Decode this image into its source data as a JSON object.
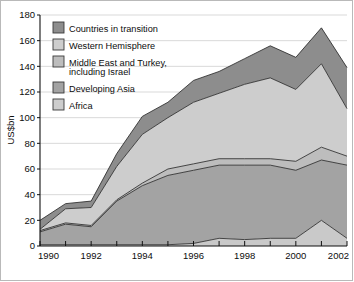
{
  "chart_data": {
    "type": "area",
    "stacked": true,
    "title": "",
    "xlabel": "",
    "ylabel": "US$bn",
    "ylim": [
      0,
      180
    ],
    "ytick_step": 20,
    "yticks": [
      0,
      20,
      40,
      60,
      80,
      100,
      120,
      140,
      160,
      180
    ],
    "xlim": [
      1990,
      2002
    ],
    "x": [
      1990,
      1991,
      1992,
      1993,
      1994,
      1995,
      1996,
      1997,
      1998,
      1999,
      2000,
      2001,
      2002
    ],
    "xticks": [
      1990,
      1991,
      1992,
      1993,
      1994,
      1995,
      1996,
      1997,
      1998,
      1999,
      2000,
      2001,
      2002
    ],
    "xtick_labels": [
      "1990",
      "",
      "1992",
      "",
      "1994",
      "",
      "1996",
      "",
      "1998",
      "",
      "2000",
      "",
      "2002"
    ],
    "grid": true,
    "grid_axis": "y",
    "legend_position": "upper-left-inside",
    "stack_order": "bottom-to-top",
    "series": [
      {
        "name": "Africa",
        "color": "#c9c9c9",
        "values": [
          1,
          1,
          1,
          1,
          1,
          1,
          2,
          6,
          5,
          6,
          6,
          20,
          6
        ]
      },
      {
        "name": "Developing Asia",
        "color": "#a3a3a3",
        "values": [
          10,
          16,
          14,
          34,
          46,
          54,
          57,
          57,
          58,
          57,
          53,
          47,
          57
        ]
      },
      {
        "name": "Middle East and Turkey, including Israel",
        "color": "#bdbdbd",
        "values": [
          1,
          1,
          1,
          1,
          2,
          5,
          5,
          5,
          5,
          5,
          7,
          10,
          7
        ]
      },
      {
        "name": "Western Hemisphere",
        "color": "#cdcdcd",
        "values": [
          1,
          11,
          14,
          26,
          38,
          40,
          48,
          51,
          58,
          63,
          56,
          65,
          37
        ]
      },
      {
        "name": "Countries in transition",
        "color": "#8d8d8d",
        "values": [
          7,
          4,
          5,
          10,
          14,
          12,
          17,
          17,
          20,
          25,
          25,
          28,
          32
        ]
      }
    ],
    "cumulative_tops": {
      "Africa": [
        1,
        1,
        1,
        1,
        1,
        1,
        2,
        6,
        5,
        6,
        6,
        20,
        6
      ],
      "Developing Asia": [
        11,
        17,
        15,
        35,
        47,
        55,
        59,
        63,
        63,
        63,
        59,
        67,
        63
      ],
      "Middle East and Turkey, including Israel": [
        12,
        18,
        16,
        36,
        49,
        60,
        64,
        68,
        68,
        68,
        66,
        77,
        70
      ],
      "Western Hemisphere": [
        13,
        29,
        30,
        62,
        87,
        100,
        112,
        119,
        126,
        131,
        122,
        142,
        107
      ],
      "Countries in transition": [
        20,
        33,
        35,
        72,
        101,
        112,
        129,
        136,
        146,
        156,
        147,
        170,
        139
      ]
    }
  },
  "legend": {
    "items": [
      {
        "label": "Countries in transition",
        "color": "#8d8d8d"
      },
      {
        "label": "Western Hemisphere",
        "color": "#cdcdcd"
      },
      {
        "label": "Middle East and Turkey,",
        "label2": "including Israel",
        "color": "#bdbdbd"
      },
      {
        "label": "Developing Asia",
        "color": "#a3a3a3"
      },
      {
        "label": "Africa",
        "color": "#cdcdcd"
      }
    ]
  },
  "axes": {
    "y_title": "US$bn",
    "y_labels": [
      "180",
      "160",
      "140",
      "120",
      "100",
      "80",
      "60",
      "40",
      "20",
      "0"
    ],
    "x_labels": [
      "1990",
      "1992",
      "1994",
      "1996",
      "1998",
      "2000",
      "2002"
    ]
  }
}
